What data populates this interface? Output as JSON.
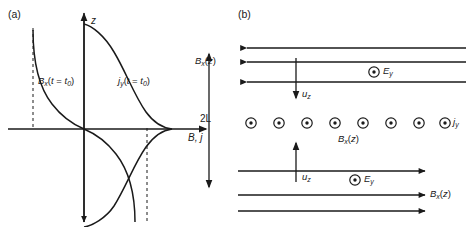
{
  "figure": {
    "panel_a": {
      "label": "(a)",
      "axes": {
        "y_axis_label": "z",
        "x_axis_label": "B, j"
      },
      "curves": [
        {
          "name": "magnetic-field-curve",
          "label_html": "B<sub>x</sub>(t = t<sub>0</sub>)",
          "label_plain": "Bx(t = t0)",
          "description": "odd tanh-like profile, negative for z>0 branch going to left asymptote"
        },
        {
          "name": "current-density-curve",
          "label_html": "j<sub>y</sub>(t = t<sub>0</sub>)",
          "label_plain": "jy(t = t0)",
          "description": "peaked sech-like profile centered on z = 0"
        }
      ],
      "dashed_asymptotes": [
        {
          "name": "left-asymptote",
          "orientation": "vertical"
        },
        {
          "name": "right-asymptote",
          "orientation": "vertical"
        }
      ]
    },
    "panel_b": {
      "label": "(b)",
      "thickness_label": "2L",
      "upper_region": {
        "field_label_html": "B<sub>x</sub>(z)",
        "field_label_plain": "Bx(z)",
        "arrow_direction": "left",
        "arrow_count": 3,
        "inflow_label_html": "u<sub>z</sub>",
        "inflow_label_plain": "uz",
        "inflow_direction": "down",
        "electric_field_label_html": "E<sub>y</sub>",
        "electric_field_label_plain": "Ey",
        "electric_field_symbol": "circle-dot-out-of-page"
      },
      "current_sheet": {
        "symbol": "circle-dot-out-of-page",
        "symbol_count": 8,
        "current_label_html": "j<sub>y</sub>",
        "current_label_plain": "jy",
        "field_label_html": "B<sub>x</sub>(z)",
        "field_label_plain": "Bx(z)"
      },
      "lower_region": {
        "field_label_html": "B<sub>x</sub>(z)",
        "field_label_plain": "Bx(z)",
        "arrow_direction": "right",
        "arrow_count": 3,
        "inflow_label_html": "u<sub>z</sub>",
        "inflow_label_plain": "uz",
        "inflow_direction": "up",
        "electric_field_label_html": "E<sub>y</sub>",
        "electric_field_label_plain": "Ey",
        "electric_field_symbol": "circle-dot-out-of-page"
      }
    }
  },
  "colors": {
    "ink": "#1a1a1a",
    "background": "#ffffff"
  }
}
